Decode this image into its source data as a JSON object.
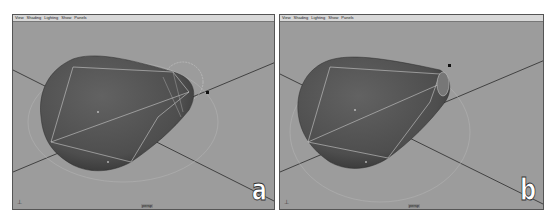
{
  "panels": [
    {
      "id": "a",
      "label": "a",
      "menu": [
        "View",
        "Shading",
        "Lighting",
        "Show",
        "Panels"
      ],
      "camera": "persp",
      "axis_indicator": "x/y/z axis",
      "object": "subdivided cone mesh (selected, tip vertices highlighted)"
    },
    {
      "id": "b",
      "label": "b",
      "menu": [
        "View",
        "Shading",
        "Lighting",
        "Show",
        "Panels"
      ],
      "camera": "persp",
      "axis_indicator": "x/y/z axis",
      "object": "subdivided cone mesh (tip collapsed)"
    }
  ],
  "colors": {
    "viewport_bg": "#9c9c9c",
    "mesh": "#5a5a5a",
    "mesh_dark": "#333333",
    "wire": "#d0d0d0",
    "grid_axis": "#2a2a2a",
    "menubar": "#d8d8d8"
  }
}
